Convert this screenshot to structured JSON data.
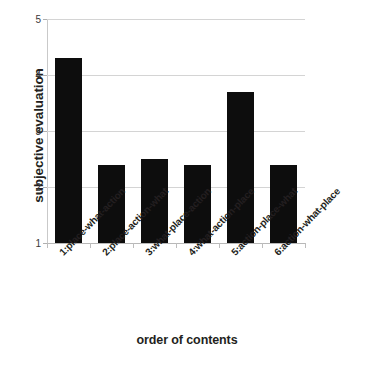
{
  "chart_data": {
    "type": "bar",
    "title": "",
    "xlabel": "order of contents",
    "ylabel": "subjective evaluation",
    "categories": [
      "1:place-what-action",
      "2:place-action-what",
      "3:what-place-action",
      "4:what-action-place",
      "5:action-place-what",
      "6:action-what-place"
    ],
    "values": [
      4.3,
      2.4,
      2.5,
      2.4,
      3.7,
      2.4
    ],
    "ylim": [
      1,
      5
    ],
    "yticks": [
      1,
      2,
      3,
      4,
      5
    ],
    "ytick_labels": [
      "1",
      "2",
      "3",
      "4",
      "5"
    ],
    "grid": "horizontal",
    "legend": "none",
    "bar_color": "#0d0d0d",
    "gridline_color": "#d4d4d4",
    "axis_color": "#c9c9c9",
    "text_color": "#231f20"
  }
}
